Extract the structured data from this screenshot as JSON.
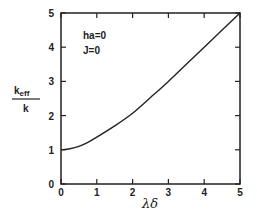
{
  "chart_data": {
    "type": "line",
    "title": "",
    "xlabel": "λδ",
    "ylabel": "k_eff / k",
    "ylabel_num": "k",
    "ylabel_num_sub": "eff",
    "ylabel_den": "k",
    "xlim": [
      0,
      5
    ],
    "ylim": [
      0,
      5
    ],
    "grid": false,
    "xticks": [
      "0",
      "1",
      "2",
      "3",
      "4",
      "5"
    ],
    "yticks": [
      "0",
      "1",
      "2",
      "3",
      "4",
      "5"
    ],
    "annotations": [
      "ha=0",
      "J=0"
    ],
    "series": [
      {
        "name": "k_eff/k",
        "x": [
          0,
          0.25,
          0.5,
          0.75,
          1.0,
          1.5,
          2.0,
          2.5,
          3.0,
          3.5,
          4.0,
          4.5,
          5.0
        ],
        "values": [
          1.0,
          1.03,
          1.1,
          1.22,
          1.37,
          1.7,
          2.07,
          2.53,
          3.0,
          3.5,
          4.0,
          4.5,
          5.0
        ]
      }
    ]
  }
}
